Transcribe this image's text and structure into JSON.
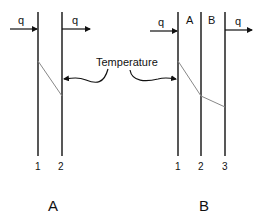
{
  "diagram": {
    "panels": [
      {
        "caption": "A",
        "walls": [
          {
            "number": "1"
          },
          {
            "number": "2"
          }
        ],
        "heat_in_label": "q",
        "heat_out_label": "q"
      },
      {
        "caption": "B",
        "walls": [
          {
            "number": "1"
          },
          {
            "number": "2"
          },
          {
            "number": "3"
          }
        ],
        "layers": [
          "A",
          "B"
        ],
        "heat_in_label": "q",
        "heat_out_label": "q"
      }
    ],
    "annotation": "Temperature",
    "colors": {
      "wall": "#111111",
      "temperature_line": "#888888",
      "background": "#ffffff"
    }
  }
}
